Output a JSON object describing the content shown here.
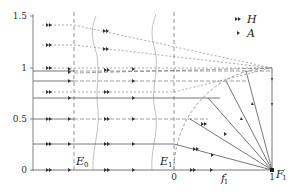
{
  "diagram": {
    "type": "phase-portrait",
    "y_axis": {
      "ticks": [
        {
          "value": 0,
          "label": "0"
        },
        {
          "value": 0.5,
          "label": "0.5"
        },
        {
          "value": 1,
          "label": "1"
        },
        {
          "value": 1.5,
          "label": "1.5"
        }
      ]
    },
    "x_ticks": [
      {
        "value": 0,
        "label": "0"
      },
      {
        "value": 1,
        "label": "1"
      }
    ],
    "x_axis_label": {
      "main": "f",
      "sub": "1",
      "prime": "′"
    },
    "points": {
      "E0": {
        "main": "E",
        "sub": "0"
      },
      "E1": {
        "main": "E",
        "sub": "1"
      },
      "F1": {
        "main": "F",
        "sub": "1",
        "prime": "′"
      }
    },
    "legend": [
      {
        "marker": "double-arrow",
        "symbol": "»",
        "label": "H"
      },
      {
        "marker": "single-arrow",
        "symbol": "›",
        "label": "A"
      }
    ],
    "colors": {
      "line": "#555555",
      "dashed": "#777777",
      "text": "#222222"
    }
  }
}
